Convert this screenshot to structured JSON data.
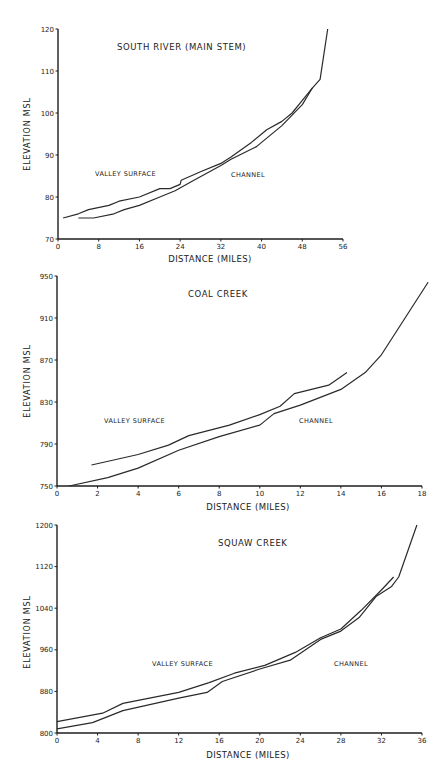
{
  "chart_data": [
    {
      "type": "line",
      "title": "SOUTH RIVER   (MAIN STEM)",
      "xlabel": "DISTANCE  (MILES)",
      "ylabel": "ELEVATION   MSL",
      "xlim": [
        0,
        56
      ],
      "ylim": [
        70,
        120
      ],
      "xticks": [
        0,
        8,
        16,
        24,
        32,
        40,
        48,
        56
      ],
      "yticks": [
        70,
        80,
        90,
        100,
        110,
        120
      ],
      "grid": false,
      "annotations": [
        {
          "text": "VALLEY  SURFACE",
          "x": 6,
          "y": 85
        },
        {
          "text": "CHANNEL",
          "x": 34,
          "y": 85
        }
      ],
      "series": [
        {
          "name": "VALLEY SURFACE",
          "x": [
            1,
            4,
            6,
            10,
            12,
            16,
            20,
            22,
            24,
            24.2,
            28,
            32,
            34,
            38,
            40,
            41,
            44,
            46,
            48,
            50
          ],
          "y": [
            75,
            76,
            77,
            78,
            79,
            80,
            82,
            82,
            83,
            84,
            86,
            88,
            89.5,
            93,
            95,
            96,
            98,
            100,
            103,
            106
          ]
        },
        {
          "name": "CHANNEL",
          "x": [
            4,
            7,
            11,
            13,
            16,
            20,
            23,
            26,
            32,
            34,
            39,
            40,
            44,
            48,
            50,
            51.5,
            53
          ],
          "y": [
            75,
            75,
            76,
            77,
            78,
            80,
            81.5,
            83.5,
            87.5,
            89,
            92,
            93,
            97,
            102,
            106,
            108,
            120
          ]
        }
      ],
      "frame": {
        "top": 29,
        "height": 222,
        "x0": 58,
        "x1": 343,
        "y0": 239,
        "y1": 29
      }
    },
    {
      "type": "line",
      "title": "COAL   CREEK",
      "xlabel": "DISTANCE  (MILES)",
      "ylabel": "ELEVATION   MSL",
      "xlim": [
        0,
        18
      ],
      "ylim": [
        750,
        950
      ],
      "xticks": [
        0,
        2,
        4,
        6,
        8,
        10,
        12,
        14,
        16,
        18
      ],
      "yticks": [
        750,
        790,
        830,
        870,
        910,
        950
      ],
      "grid": false,
      "annotations": [
        {
          "text": "VALLEY  SURFACE",
          "x": 2.3,
          "y": 808
        },
        {
          "text": "CHANNEL",
          "x": 12,
          "y": 808
        }
      ],
      "series": [
        {
          "name": "VALLEY SURFACE",
          "x": [
            1.7,
            4,
            5.5,
            6.5,
            8.5,
            10,
            11,
            11.7,
            13.4,
            14.3
          ],
          "y": [
            770,
            780,
            789,
            798,
            808,
            818,
            826,
            838,
            846,
            858
          ]
        },
        {
          "name": "CHANNEL",
          "x": [
            0.6,
            2.5,
            4,
            6,
            8,
            10,
            10.7,
            12,
            14,
            15.2,
            16,
            18.3
          ],
          "y": [
            750,
            758,
            767,
            784,
            797,
            808,
            819,
            827,
            842,
            858,
            875,
            944
          ]
        }
      ],
      "frame": {
        "x0": 57,
        "x1": 422,
        "y0": 486,
        "y1": 276
      }
    },
    {
      "type": "line",
      "title": "SQUAW   CREEK",
      "xlabel": "DISTANCE  (MILES)",
      "ylabel": "ELEVATION   MSL",
      "xlim": [
        0,
        36
      ],
      "ylim": [
        800,
        1200
      ],
      "xticks": [
        0,
        4,
        8,
        12,
        16,
        20,
        24,
        28,
        32,
        36
      ],
      "yticks": [
        800,
        880,
        960,
        1040,
        1120,
        1200
      ],
      "grid": false,
      "annotations": [
        {
          "text": "VALLEY  SURFACE",
          "x": 9.4,
          "y": 930
        },
        {
          "text": "CHANNEL",
          "x": 27.3,
          "y": 930
        }
      ],
      "series": [
        {
          "name": "VALLEY SURFACE",
          "x": [
            0,
            4.5,
            6.5,
            12,
            15,
            17.5,
            20.5,
            23.5,
            26,
            28,
            30,
            32,
            33.2
          ],
          "y": [
            822,
            838,
            857,
            878,
            897,
            915,
            930,
            955,
            983,
            1000,
            1036,
            1075,
            1100
          ]
        },
        {
          "name": "CHANNEL",
          "x": [
            0,
            3.5,
            6.5,
            12,
            14.8,
            16.3,
            20,
            23,
            26,
            28,
            29.8,
            31.5,
            33,
            33.7,
            35.5
          ],
          "y": [
            808,
            820,
            843,
            867,
            878,
            899,
            923,
            940,
            980,
            996,
            1022,
            1063,
            1082,
            1100,
            1200
          ]
        }
      ],
      "frame": {
        "x0": 57,
        "x1": 422,
        "y0": 733,
        "y1": 525
      }
    }
  ],
  "labels": {
    "c0": {
      "title": "SOUTH RIVER   (MAIN STEM)",
      "xlabel": "DISTANCE  (MILES)",
      "ylabel": "ELEVATION   MSL",
      "valley": "VALLEY  SURFACE",
      "channel": "CHANNEL"
    },
    "c1": {
      "title": "COAL   CREEK",
      "xlabel": "DISTANCE  (MILES)",
      "ylabel": "ELEVATION   MSL",
      "valley": "VALLEY  SURFACE",
      "channel": "CHANNEL"
    },
    "c2": {
      "title": "SQUAW   CREEK",
      "xlabel": "DISTANCE  (MILES)",
      "ylabel": "ELEVATION   MSL",
      "valley": "VALLEY  SURFACE",
      "channel": "CHANNEL"
    }
  },
  "colors": {
    "line": "#2a2a2a",
    "axis": "#1e1e1e",
    "background": "#ffffff"
  }
}
